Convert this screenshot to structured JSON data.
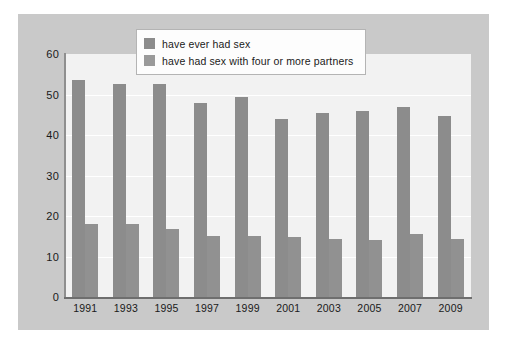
{
  "chart_data": {
    "type": "bar",
    "title": "",
    "xlabel": "",
    "ylabel": "",
    "ylim": [
      0,
      60
    ],
    "ytick_step": 10,
    "yticks": [
      60,
      50,
      40,
      30,
      20,
      10,
      0
    ],
    "grid": true,
    "legend_position": "top-center",
    "categories": [
      "1991",
      "1993",
      "1995",
      "1997",
      "1999",
      "2001",
      "2003",
      "2005",
      "2007",
      "2009"
    ],
    "series": [
      {
        "name": "have ever had sex",
        "color": "#8c8c8c",
        "values": [
          53.5,
          52.5,
          52.5,
          48.0,
          49.5,
          44.0,
          45.5,
          46.0,
          47.0,
          44.8
        ]
      },
      {
        "name": "have had sex with four or more partners",
        "color": "#919191",
        "values": [
          18.0,
          18.0,
          16.8,
          15.0,
          15.0,
          14.8,
          14.4,
          14.0,
          15.6,
          14.2
        ]
      }
    ]
  },
  "legend": {
    "items": [
      {
        "label": "have ever had sex",
        "swatch": "legend-swatch-series-a"
      },
      {
        "label": "have had sex with four or more partners",
        "swatch": "legend-swatch-series-b"
      }
    ]
  },
  "colors": {
    "card_background": "#c9c9c9",
    "plot_background": "#f2f2f2",
    "gridline": "#ffffff",
    "axis": "#6e6e6e",
    "bar_series_a": "#8c8c8c",
    "bar_series_b": "#919191",
    "text": "#1a1a1a"
  }
}
